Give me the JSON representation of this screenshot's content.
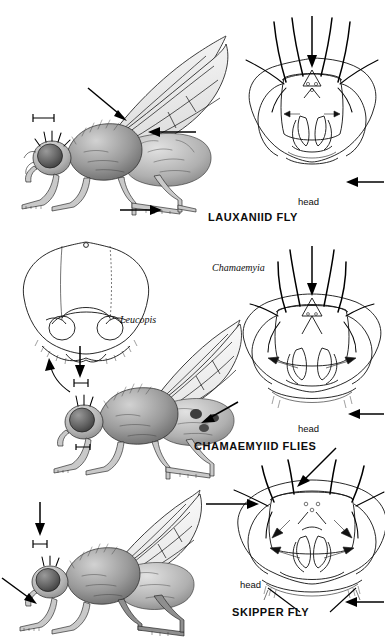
{
  "plate": {
    "title_visible": false,
    "background": "#ffffff",
    "ink": "#111111",
    "panel_count": 3
  },
  "panels": [
    {
      "id": "lauxaniid",
      "caption": "LAUXANIID FLY",
      "head_label": "head",
      "genus_labels": [],
      "figures": [
        "lateral habitus",
        "frontal head"
      ],
      "pointers": 4,
      "scale_bar": true
    },
    {
      "id": "chamaemyiid",
      "caption": "CHAMAEMYIID FLIES",
      "head_label": "head",
      "genus_labels": [
        "Leucopis",
        "Chamaemyia"
      ],
      "figures": [
        "frontal head (Leucopis)",
        "lateral habitus (Leucopis)",
        "frontal head (Chamaemyia)"
      ],
      "pointers": 5,
      "scale_bar": true
    },
    {
      "id": "skipper",
      "caption": "SKIPPER FLY",
      "head_label": "head",
      "genus_labels": [],
      "figures": [
        "lateral habitus",
        "frontal head"
      ],
      "pointers": 5,
      "scale_bar": true
    }
  ],
  "labels": {
    "lauxaniid_caption": "LAUXANIID FLY",
    "lauxaniid_head": "head",
    "chamaemyiid_caption": "CHAMAEMYIID FLIES",
    "chamaemyiid_head": "head",
    "chamaemyiid_genus_left": "Leucopis",
    "chamaemyiid_genus_right": "Chamaemyia",
    "skipper_caption": "SKIPPER FLY",
    "skipper_head": "head"
  },
  "colors": {
    "background": "#ffffff",
    "line": "#111111",
    "wing_fill_light": "#f2f2f2",
    "wing_fill_mid": "#dedede",
    "body_dark": "#6e6e6e",
    "body_light": "#cfcfcf"
  }
}
